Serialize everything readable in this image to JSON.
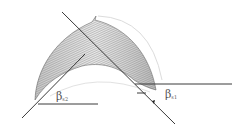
{
  "diagram": {
    "colors": {
      "background": "#ffffff",
      "lines": "#3a3a3a",
      "hatch": "#888888",
      "guide_arcs": "#d8d8d8",
      "label": "#555555"
    },
    "labels": {
      "beta_left": {
        "symbol": "β",
        "subscript": "s2"
      },
      "beta_right": {
        "symbol": "β",
        "subscript": "s1"
      }
    }
  }
}
